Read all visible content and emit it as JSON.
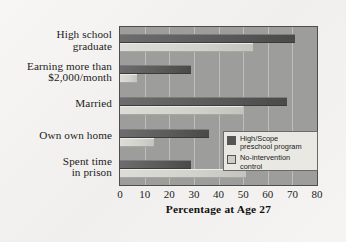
{
  "chart_data": {
    "type": "bar",
    "orientation": "horizontal",
    "title": "",
    "xlabel": "Percentage at Age 27",
    "ylabel": "",
    "xlim": [
      0,
      80
    ],
    "xticks": [
      0,
      10,
      20,
      30,
      40,
      50,
      60,
      70,
      80
    ],
    "grid": true,
    "legend_position": "center-right",
    "categories": [
      "High school graduate",
      "Earning more than $2,000/month",
      "Married",
      "Own own home",
      "Spent time in prison"
    ],
    "category_lines": [
      [
        "High school",
        "graduate"
      ],
      [
        "Earning more than",
        "$2,000/month"
      ],
      [
        "Married"
      ],
      [
        "Own own home"
      ],
      [
        "Spent time",
        "in prison"
      ]
    ],
    "series": [
      {
        "name": "High/Scope preschool program",
        "color": "#585858",
        "values": [
          71,
          29,
          68,
          36,
          29
        ]
      },
      {
        "name": "No-intervention control",
        "color": "#d2d2cd",
        "values": [
          54,
          7,
          50,
          14,
          51
        ]
      }
    ]
  },
  "legend": {
    "entries": [
      {
        "label_lines": [
          "High/Scope",
          "preschool program"
        ],
        "swatch": "dark"
      },
      {
        "label_lines": [
          "No-intervention control"
        ],
        "swatch": "light"
      }
    ]
  },
  "axis": {
    "x_title": "Percentage at Age 27",
    "tick_labels": [
      "0",
      "10",
      "20",
      "30",
      "40",
      "50",
      "60",
      "70",
      "80"
    ]
  },
  "colors": {
    "page_background": "#f4f3f1",
    "plot_background": "#9d9d9b",
    "gridline": "#c9c9c5",
    "axis_border": "#4d4d4d",
    "series_dark": "#585858",
    "series_light": "#d2d2cd",
    "legend_background": "#e9e8e3",
    "text": "#1b1b1b"
  }
}
